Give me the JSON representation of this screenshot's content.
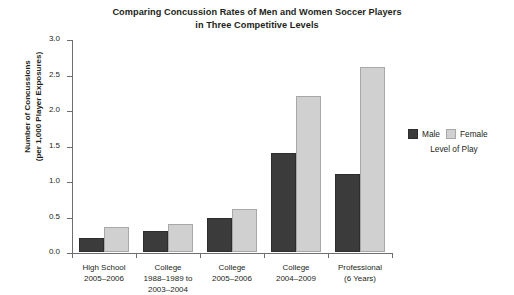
{
  "chart_data": {
    "type": "bar",
    "title": "Comparing Concussion Rates of Men and Women Soccer Players in Three Competitive Levels",
    "title_lines": [
      "Comparing Concussion Rates of Men and Women Soccer Players",
      "in Three Competitive Levels"
    ],
    "xlabel": "Level of Play",
    "ylabel": "Number of Concussions (per 1,000 Player Exposures)",
    "ylabel_lines": [
      "Number of Concussions",
      "(per 1,000 Player Exposures)"
    ],
    "ylim": [
      0,
      3.0
    ],
    "ytick_labels": [
      "0.0",
      "0.5",
      "1.0",
      "1.5",
      "2.0",
      "2.5",
      "3.0"
    ],
    "ytick_values": [
      0.0,
      0.5,
      1.0,
      1.5,
      2.0,
      2.5,
      3.0
    ],
    "grid": false,
    "legend_position": "right",
    "categories": [
      "High School 2005–2006",
      "College 1988–1989 to 2003–2004",
      "College 2005–2006",
      "College 2004–2009",
      "Professional (6 Years)"
    ],
    "category_lines": [
      [
        "High School",
        "2005–2006"
      ],
      [
        "College",
        "1988–1989 to",
        "2003–2004"
      ],
      [
        "College",
        "2005–2006"
      ],
      [
        "College",
        "2004–2009"
      ],
      [
        "Professional",
        "(6 Years)"
      ]
    ],
    "series": [
      {
        "name": "Male",
        "color": "#3b3b3b",
        "values": [
          0.2,
          0.3,
          0.48,
          1.4,
          1.1
        ]
      },
      {
        "name": "Female",
        "color": "#d0d0d0",
        "values": [
          0.35,
          0.4,
          0.6,
          2.2,
          2.6
        ]
      }
    ]
  },
  "legend": {
    "male_label": "Male",
    "female_label": "Female",
    "caption": "Level of Play"
  }
}
